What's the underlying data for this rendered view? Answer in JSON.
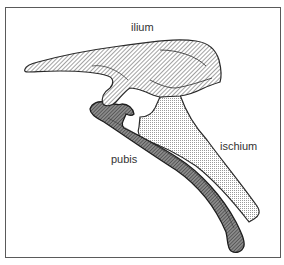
{
  "figure": {
    "labels": {
      "ilium": "ilium",
      "ischium": "ischium",
      "pubis": "pubis"
    },
    "colors": {
      "outline": "#2a2a2a",
      "frame": "#5a5a5a",
      "ilium_fill": "#a8a8a8",
      "ischium_fill": "#e4e4e4",
      "pubis_fill": "#6a6a6a"
    }
  }
}
